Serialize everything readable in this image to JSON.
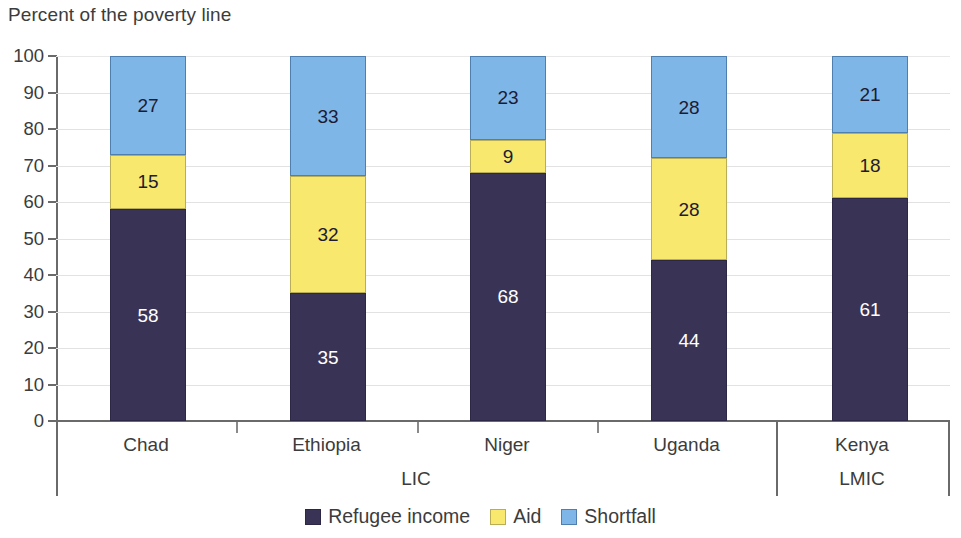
{
  "chart_data": {
    "type": "bar",
    "title": "Percent of the poverty line",
    "subtitle": "",
    "xlabel": "",
    "ylabel": "",
    "stacked": true,
    "grid": true,
    "legend_position": "bottom-center",
    "ylim": [
      0,
      100
    ],
    "yticks": [
      0,
      10,
      20,
      30,
      40,
      50,
      60,
      70,
      80,
      90,
      100
    ],
    "ytick_labels": [
      "0",
      "10",
      "20",
      "30",
      "40",
      "50",
      "60",
      "70",
      "80",
      "90",
      "100"
    ],
    "categories": [
      "Chad",
      "Ethiopia",
      "Niger",
      "Uganda",
      "Kenya"
    ],
    "groups": [
      {
        "label": "LIC",
        "categories": [
          "Chad",
          "Ethiopia",
          "Niger",
          "Uganda"
        ]
      },
      {
        "label": "LMIC",
        "categories": [
          "Kenya"
        ]
      }
    ],
    "series": [
      {
        "name": "Refugee income",
        "color": "#393456",
        "label_color": "#ffffff",
        "values": [
          58,
          35,
          68,
          44,
          61
        ]
      },
      {
        "name": "Aid",
        "color": "#f9e86e",
        "label_color": "#1d1b33",
        "values": [
          15,
          32,
          9,
          28,
          18
        ]
      },
      {
        "name": "Shortfall",
        "color": "#7fb6e8",
        "label_color": "#1d1b33",
        "values": [
          27,
          33,
          23,
          28,
          21
        ]
      }
    ],
    "bar_labels": [
      {
        "category": "Chad",
        "Refugee income": "58",
        "Aid": "15",
        "Shortfall": "27"
      },
      {
        "category": "Ethiopia",
        "Refugee income": "35",
        "Aid": "32",
        "Shortfall": "33"
      },
      {
        "category": "Niger",
        "Refugee income": "68",
        "Aid": "9",
        "Shortfall": "23"
      },
      {
        "category": "Uganda",
        "Refugee income": "44",
        "Aid": "28",
        "Shortfall": "28"
      },
      {
        "category": "Kenya",
        "Refugee income": "61",
        "Aid": "18",
        "Shortfall": "21"
      }
    ]
  },
  "legend": {
    "items": [
      {
        "label": "Refugee income",
        "swatch": "income"
      },
      {
        "label": "Aid",
        "swatch": "aid"
      },
      {
        "label": "Shortfall",
        "swatch": "short"
      }
    ]
  },
  "colors": {
    "refugee_income": "#393456",
    "aid": "#f9e86e",
    "shortfall": "#7fb6e8",
    "gridline": "#e2e2e2",
    "axis": "#6a6a6a",
    "text": "#3c3c3c"
  }
}
